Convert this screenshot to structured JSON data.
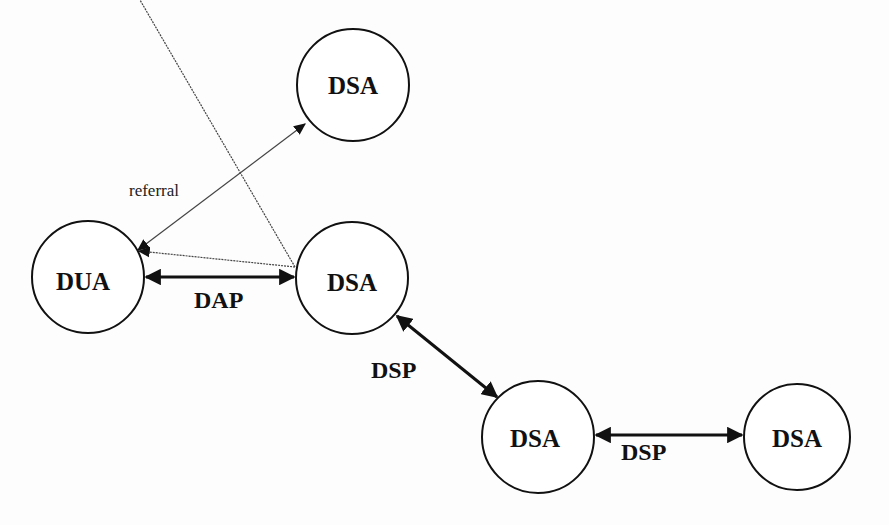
{
  "diagram": {
    "nodes": [
      {
        "id": "dsa-top",
        "label": "DSA",
        "cx": 353,
        "cy": 85,
        "r": 56
      },
      {
        "id": "dua",
        "label": "DUA",
        "cx": 88,
        "cy": 277,
        "r": 56
      },
      {
        "id": "dsa-mid",
        "label": "DSA",
        "cx": 352,
        "cy": 278,
        "r": 56
      },
      {
        "id": "dsa-low",
        "label": "DSA",
        "cx": 538,
        "cy": 437,
        "r": 56
      },
      {
        "id": "dsa-right",
        "label": "DSA",
        "cx": 797,
        "cy": 437,
        "r": 53
      }
    ],
    "edges": [
      {
        "id": "referral-edge",
        "from": "dua",
        "to": "dsa-top",
        "style": "thin",
        "arrows": "both",
        "label": "referral"
      },
      {
        "id": "referral-return",
        "from": "dsa-mid",
        "to": "dua",
        "style": "thin",
        "arrows": "end",
        "label": ""
      },
      {
        "id": "dap-edge",
        "from": "dua",
        "to": "dsa-mid",
        "style": "bold",
        "arrows": "both",
        "label": "DAP"
      },
      {
        "id": "dsp-edge-1",
        "from": "dsa-mid",
        "to": "dsa-low",
        "style": "bold",
        "arrows": "both",
        "label": "DSP"
      },
      {
        "id": "dsp-edge-2",
        "from": "dsa-low",
        "to": "dsa-right",
        "style": "bold",
        "arrows": "both",
        "label": "DSP"
      }
    ],
    "labels": {
      "referral": "referral",
      "dap": "DAP",
      "dsp1": "DSP",
      "dsp2": "DSP"
    }
  }
}
